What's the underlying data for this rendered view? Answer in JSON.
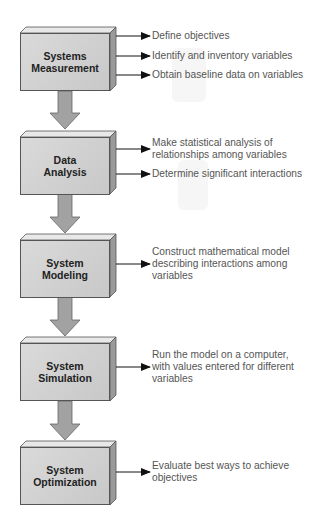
{
  "diagram": {
    "type": "flowchart",
    "direction": "top-to-bottom",
    "colors": {
      "box_face": "#d2d2d2",
      "box_top": "#e6e6e6",
      "box_side": "#9a9a9a",
      "box_border": "#555555",
      "flow_arrow": "#9e9e9e",
      "flow_arrow_border": "#666666",
      "pointer_arrow": "#111111",
      "text_box": "#222222",
      "text_desc": "#555555"
    },
    "steps": [
      {
        "label": "Systems\nMeasurement",
        "outputs": [
          "Define objectives",
          "Identify and inventory variables",
          "Obtain baseline data on variables"
        ]
      },
      {
        "label": "Data\nAnalysis",
        "outputs": [
          "Make statistical analysis of\nrelationships among variables",
          "Determine significant interactions"
        ]
      },
      {
        "label": "System\nModeling",
        "outputs": [
          "Construct mathematical model\ndescribing interactions among\nvariables"
        ]
      },
      {
        "label": "System\nSimulation",
        "outputs": [
          "Run the model on a computer,\nwith values entered for different\nvariables"
        ]
      },
      {
        "label": "System\nOptimization",
        "outputs": [
          "Evaluate best ways to achieve\nobjectives"
        ]
      }
    ]
  }
}
